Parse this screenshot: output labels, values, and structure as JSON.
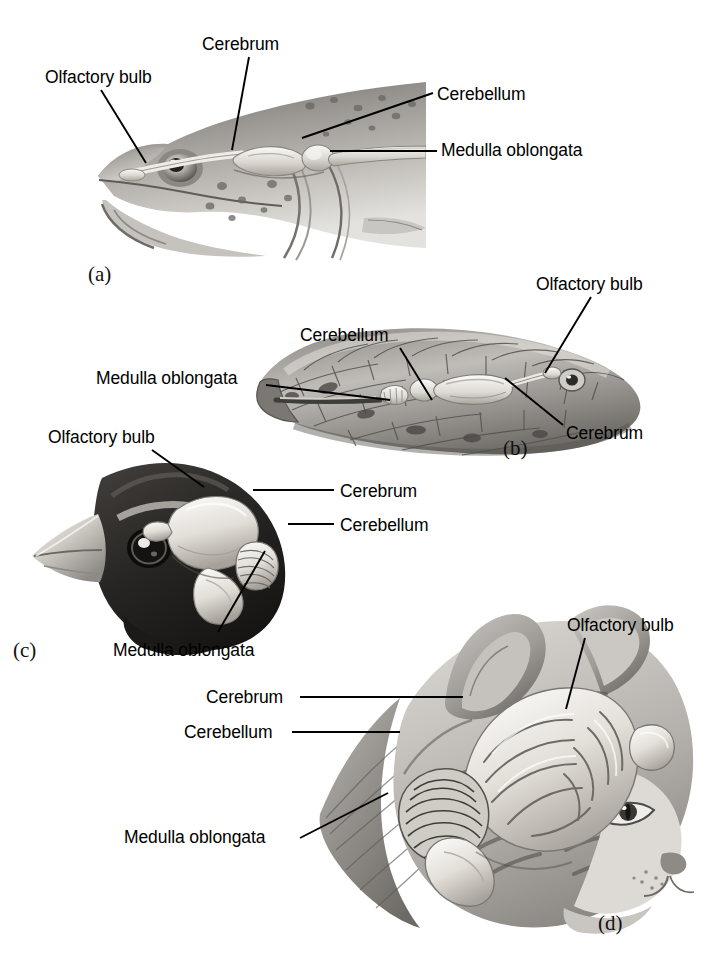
{
  "figure": {
    "background_color": "#ffffff",
    "line_color": "#000000",
    "text_color": "#000000"
  },
  "panels": [
    {
      "letter": "(a)",
      "animal": "fish",
      "labels": [
        {
          "text": "Olfactory bulb",
          "x": 45,
          "y": 68
        },
        {
          "text": "Cerebrum",
          "x": 202,
          "y": 35
        },
        {
          "text": "Cerebellum",
          "x": 437,
          "y": 85
        },
        {
          "text": "Medulla oblongata",
          "x": 441,
          "y": 141
        }
      ]
    },
    {
      "letter": "(b)",
      "animal": "snake",
      "labels": [
        {
          "text": "Cerebellum",
          "x": 300,
          "y": 326
        },
        {
          "text": "Olfactory bulb",
          "x": 536,
          "y": 275
        },
        {
          "text": "Medulla oblongata",
          "x": 96,
          "y": 369
        },
        {
          "text": "Cerebrum",
          "x": 566,
          "y": 424
        }
      ]
    },
    {
      "letter": "(c)",
      "animal": "bird",
      "labels": [
        {
          "text": "Olfactory bulb",
          "x": 48,
          "y": 428
        },
        {
          "text": "Cerebrum",
          "x": 340,
          "y": 482
        },
        {
          "text": "Cerebellum",
          "x": 340,
          "y": 516
        },
        {
          "text": "Medulla oblongata",
          "x": 113,
          "y": 641
        }
      ]
    },
    {
      "letter": "(d)",
      "animal": "cat",
      "labels": [
        {
          "text": "Olfactory bulb",
          "x": 567,
          "y": 616
        },
        {
          "text": "Cerebrum",
          "x": 206,
          "y": 688
        },
        {
          "text": "Cerebellum",
          "x": 184,
          "y": 723
        },
        {
          "text": "Medulla oblongata",
          "x": 124,
          "y": 828
        }
      ]
    }
  ],
  "panel_letters": [
    {
      "text": "(a)",
      "x": 88,
      "y": 262
    },
    {
      "text": "(b)",
      "x": 503,
      "y": 436
    },
    {
      "text": "(c)",
      "x": 13,
      "y": 638
    },
    {
      "text": "(d)",
      "x": 598,
      "y": 911
    }
  ],
  "leader_lines": [
    {
      "name": "fish-olfactory-bulb",
      "x1": 101,
      "y1": 90,
      "x2": 146,
      "y2": 163
    },
    {
      "name": "fish-cerebrum",
      "x1": 249,
      "y1": 57,
      "x2": 232,
      "y2": 150
    },
    {
      "name": "fish-cerebellum",
      "x1": 302,
      "y1": 138,
      "x2": 433,
      "y2": 93
    },
    {
      "name": "fish-medulla-oblongata",
      "x1": 330,
      "y1": 151,
      "x2": 437,
      "y2": 151
    },
    {
      "name": "snake-cerebellum",
      "x1": 400,
      "y1": 348,
      "x2": 432,
      "y2": 400
    },
    {
      "name": "snake-olfactory-bulb",
      "x1": 591,
      "y1": 297,
      "x2": 545,
      "y2": 373
    },
    {
      "name": "snake-medulla-oblongata",
      "x1": 266,
      "y1": 385,
      "x2": 390,
      "y2": 400
    },
    {
      "name": "snake-cerebrum",
      "x1": 563,
      "y1": 425,
      "x2": 505,
      "y2": 378
    },
    {
      "name": "bird-olfactory-bulb",
      "x1": 152,
      "y1": 450,
      "x2": 204,
      "y2": 487
    },
    {
      "name": "bird-cerebrum",
      "x1": 334,
      "y1": 490,
      "x2": 253,
      "y2": 490
    },
    {
      "name": "bird-cerebellum",
      "x1": 334,
      "y1": 524,
      "x2": 288,
      "y2": 524
    },
    {
      "name": "bird-medulla-oblongata",
      "x1": 218,
      "y1": 632,
      "x2": 265,
      "y2": 551
    },
    {
      "name": "cat-olfactory-bulb",
      "x1": 585,
      "y1": 638,
      "x2": 566,
      "y2": 709
    },
    {
      "name": "cat-cerebrum",
      "x1": 300,
      "y1": 697,
      "x2": 463,
      "y2": 697
    },
    {
      "name": "cat-cerebellum",
      "x1": 292,
      "y1": 732,
      "x2": 400,
      "y2": 732
    },
    {
      "name": "cat-medulla-oblongata",
      "x1": 300,
      "y1": 838,
      "x2": 388,
      "y2": 793
    }
  ]
}
